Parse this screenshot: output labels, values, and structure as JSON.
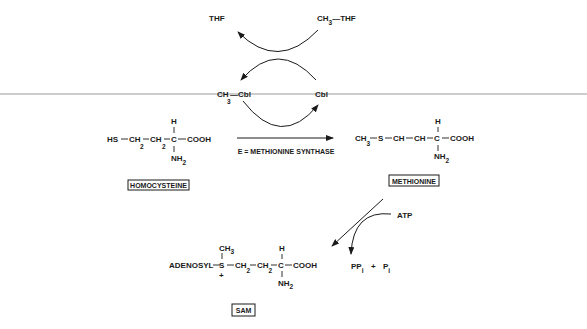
{
  "cycle": {
    "thf": "THF",
    "methyl_thf": {
      "prefix": "CH",
      "sub": "3",
      "suffix": "—THF"
    },
    "methyl_cbl": {
      "prefix": "CH",
      "sub": "3",
      "suffix": "—Cbl"
    },
    "cbl": "Cbl"
  },
  "homocysteine": {
    "chain": [
      "HS",
      "CH",
      "CH",
      "C",
      "COOH"
    ],
    "subs": [
      "2",
      "2"
    ],
    "h": "H",
    "nh2": {
      "prefix": "NH",
      "sub": "2"
    },
    "label": "HOMOCYSTEINE"
  },
  "reaction": {
    "enzyme": "E = METHIONINE SYNTHASE"
  },
  "methionine": {
    "ch3": {
      "prefix": "CH",
      "sub": "3"
    },
    "chain": [
      "S",
      "CH",
      "CH",
      "C",
      "COOH"
    ],
    "h": "H",
    "nh2": {
      "prefix": "NH",
      "sub": "2"
    },
    "label": "METHIONINE"
  },
  "atp_step": {
    "atp": "ATP",
    "ppi": {
      "prefix": "PP",
      "sub": "i"
    },
    "plus": "+",
    "pi": {
      "prefix": "P",
      "sub": "i"
    }
  },
  "sam": {
    "adenosyl": "ADENOSYL",
    "s": "S",
    "charge": "+",
    "methyl": {
      "prefix": "CH",
      "sub": "3"
    },
    "ch2a": {
      "prefix": "CH",
      "sub": "2"
    },
    "ch2b": {
      "prefix": "CH",
      "sub": "2"
    },
    "c": "C",
    "h": "H",
    "cooh": "COOH",
    "nh2": {
      "prefix": "NH",
      "sub": "2"
    },
    "label": "SAM"
  }
}
